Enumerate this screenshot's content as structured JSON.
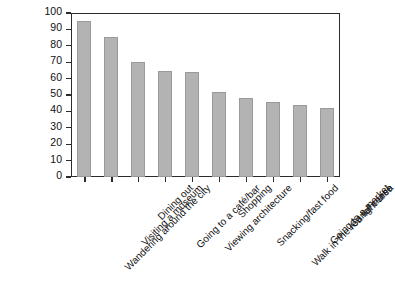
{
  "chart_data": {
    "type": "bar",
    "title": "",
    "subtitle": "",
    "xlabel": "",
    "ylabel": "",
    "ylim": [
      0,
      100
    ],
    "yticks": [
      0,
      10,
      20,
      30,
      40,
      50,
      60,
      70,
      80,
      90,
      100
    ],
    "ytick_labels": [
      "0",
      "10",
      "20",
      "30",
      "40",
      "50",
      "60",
      "70",
      "80",
      "90",
      "100"
    ],
    "grid": false,
    "legend": false,
    "legend_position": "none",
    "bar_color": "#b3b3b3",
    "bar_edge_color": "#9a9a9a",
    "axis_color": "#2b2b2b",
    "xtick_label_rotation": -45,
    "categories": [
      "Wandering around the city",
      "Visiting a museum",
      "Dining out",
      "Going to a café/bar",
      "Viewing architecture",
      "Shopping",
      "Snacking/fast food",
      "Walk in the red light area",
      "Going to a market",
      "Canal cruise"
    ],
    "values": [
      95,
      85.5,
      70,
      64.5,
      64,
      52,
      48,
      45.5,
      44,
      42
    ],
    "series": [
      {
        "name": "Activity share",
        "values": [
          95,
          85.5,
          70,
          64.5,
          64,
          52,
          48,
          45.5,
          44,
          42
        ]
      }
    ]
  }
}
